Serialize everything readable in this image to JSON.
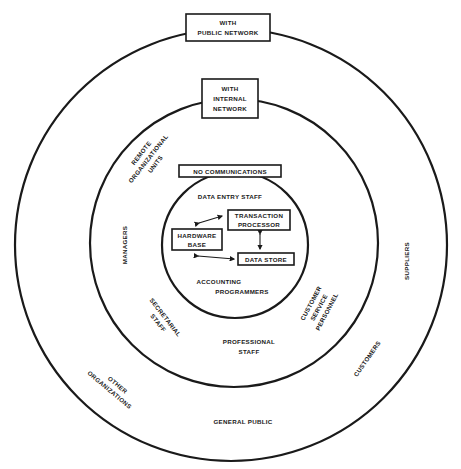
{
  "diagram": {
    "type": "concentric-circles",
    "rings": {
      "outer": {
        "box_label_lines": [
          "WITH",
          "PUBLIC NETWORK"
        ],
        "labels": {
          "suppliers": "SUPPLIERS",
          "customers": "CUSTOMERS",
          "other_organizations": [
            "OTHER",
            "ORGANIZATIONS"
          ],
          "general_public": "GENERAL PUBLIC"
        }
      },
      "middle": {
        "box_label_lines": [
          "WITH",
          "INTERNAL",
          "NETWORK"
        ],
        "labels": {
          "remote_units": [
            "REMOTE",
            "ORGANIZATIONAL",
            "UNITS"
          ],
          "managers": "MANAGERS",
          "secretarial_staff": [
            "SECRETARIAL",
            "STAFF"
          ],
          "professional_staff": [
            "PROFESSIONAL",
            "STAFF"
          ],
          "customer_service": [
            "CUSTOMER",
            "SERVICE",
            "PERSONNEL"
          ]
        }
      },
      "inner": {
        "box_label": "NO COMMUNICATIONS",
        "labels": {
          "data_entry_staff": "DATA ENTRY STAFF",
          "accounting": "ACCOUNTING",
          "programmers": "PROGRAMMERS"
        },
        "nodes": {
          "transaction_processor": [
            "TRANSACTION",
            "PROCESSOR"
          ],
          "hardware_base": [
            "HARDWARE",
            "BASE"
          ],
          "data_store": "DATA STORE"
        }
      }
    }
  }
}
